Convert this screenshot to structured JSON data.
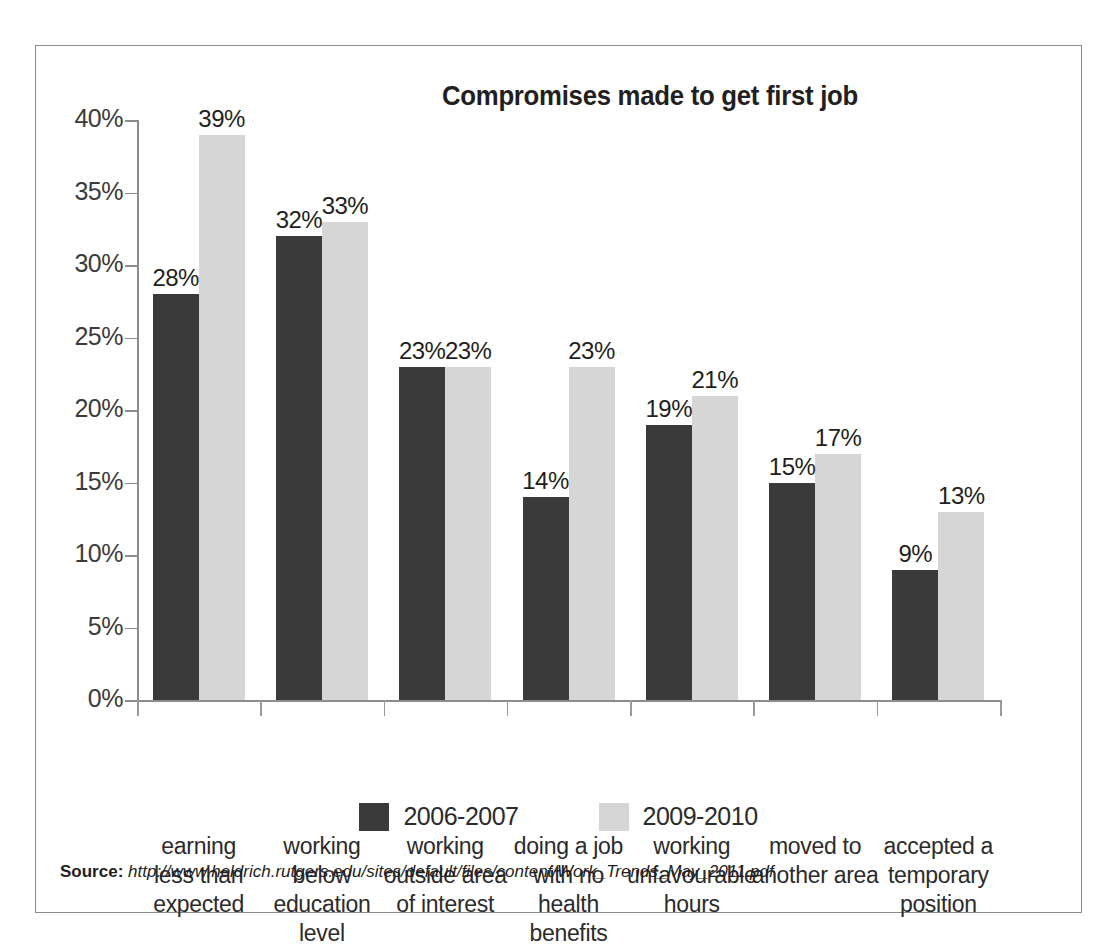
{
  "figure": {
    "title": "Compromises made to get first job",
    "source_label": "Source:",
    "source_url": "http://www.heldrich.rutgers.edu/sites/default/files/content/Work_Trends_May_2011.pdf"
  },
  "axis": {
    "y_ticks": [
      "0%",
      "5%",
      "10%",
      "15%",
      "20%",
      "25%",
      "30%",
      "35%",
      "40%"
    ]
  },
  "legend": {
    "items": [
      {
        "label": "2006-2007",
        "color": "#3a3a3a"
      },
      {
        "label": "2009-2010",
        "color": "#d6d6d6"
      }
    ]
  },
  "labels": {
    "s0": [
      "28%",
      "32%",
      "23%",
      "14%",
      "19%",
      "15%",
      "9%"
    ],
    "s1": [
      "39%",
      "33%",
      "23%",
      "23%",
      "21%",
      "17%",
      "13%"
    ]
  },
  "categories_lines": [
    [
      "earning",
      "less than",
      "expected"
    ],
    [
      "working below",
      "education",
      "level"
    ],
    [
      "working",
      "outside area",
      "of interest"
    ],
    [
      "doing a job",
      "with no",
      "health benefits"
    ],
    [
      "working",
      "unfavourable",
      "hours"
    ],
    [
      "moved to",
      "another area"
    ],
    [
      "accepted a",
      "temporary",
      "position"
    ]
  ],
  "chart_data": {
    "type": "bar",
    "title": "Compromises made to get first job",
    "xlabel": "",
    "ylabel": "",
    "ylim": [
      0,
      40
    ],
    "ytick_step": 5,
    "ytick_format": "percent",
    "grid": false,
    "legend_position": "bottom",
    "categories": [
      "earning less than expected",
      "working below education level",
      "working outside area of interest",
      "doing a job with no health benefits",
      "working unfavourable hours",
      "moved to another area",
      "accepted a temporary position"
    ],
    "series": [
      {
        "name": "2006-2007",
        "color": "#3a3a3a",
        "values": [
          28,
          32,
          23,
          14,
          19,
          15,
          9
        ]
      },
      {
        "name": "2009-2010",
        "color": "#d6d6d6",
        "values": [
          39,
          33,
          23,
          23,
          21,
          17,
          13
        ]
      }
    ]
  }
}
